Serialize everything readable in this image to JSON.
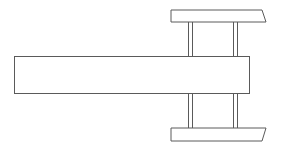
{
  "diagram": {
    "title": "",
    "background": "#ffffff",
    "stroke_color": "#5a5a5a",
    "fill_color": "#ffffff",
    "shapes": {
      "main_beam": {
        "x": 14,
        "y": 56,
        "w": 235,
        "h": 37
      },
      "top_bar": {
        "points": "171,10 262,10 266,22 171,22"
      },
      "bottom_bar": {
        "points": "171,128 266,128 262,141 171,141"
      },
      "posts": [
        {
          "x1": 188,
          "x2": 192,
          "y_top": 22,
          "y_bottom": 56
        },
        {
          "x1": 233,
          "x2": 237,
          "y_top": 22,
          "y_bottom": 56
        },
        {
          "x1": 188,
          "x2": 192,
          "y_top": 93,
          "y_bottom": 128
        },
        {
          "x1": 233,
          "x2": 237,
          "y_top": 93,
          "y_bottom": 128
        }
      ]
    }
  }
}
